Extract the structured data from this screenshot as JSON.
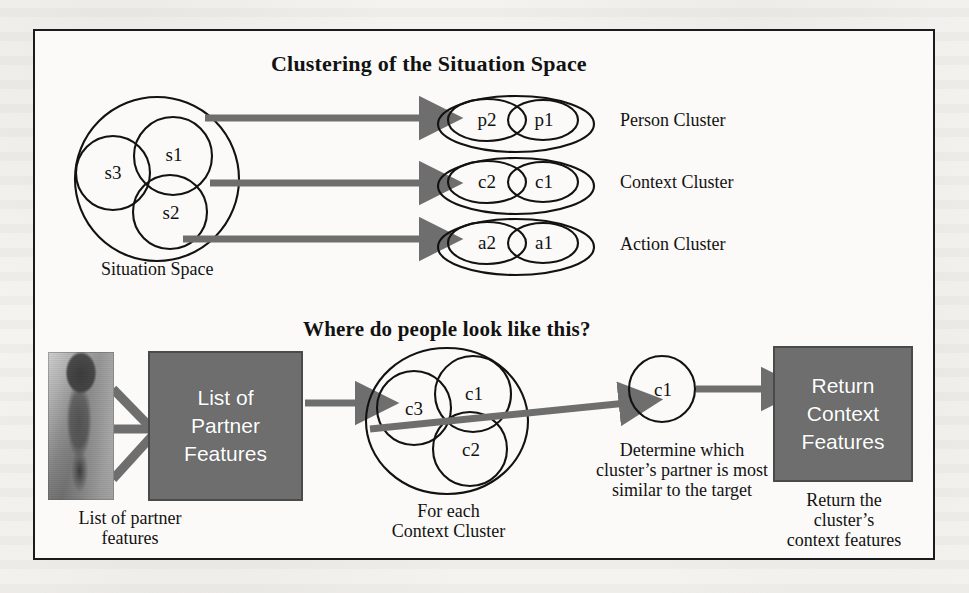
{
  "figure": {
    "top_section": {
      "title": "Clustering of the Situation Space",
      "source": {
        "label": "Situation Space",
        "members": [
          "s3",
          "s1",
          "s2"
        ]
      },
      "clusters": [
        {
          "members": [
            "p2",
            "p1"
          ],
          "label": "Person Cluster"
        },
        {
          "members": [
            "c2",
            "c1"
          ],
          "label": "Context Cluster"
        },
        {
          "members": [
            "a2",
            "a1"
          ],
          "label": "Action Cluster"
        }
      ]
    },
    "bottom_section": {
      "title": "Where do people look like this?",
      "photo": {
        "alt": "person-photo",
        "caption_line1": "List of partner",
        "caption_line2": "features"
      },
      "input_box": {
        "line1": "List of",
        "line2": "Partner",
        "line3": "Features"
      },
      "cluster": {
        "members": [
          "c3",
          "c1",
          "c2"
        ],
        "caption_line1": "For each",
        "caption_line2": "Context Cluster"
      },
      "selected_node": {
        "label": "c1",
        "caption_line1": "Determine which",
        "caption_line2": "cluster’s partner is most",
        "caption_line3": "similar to the target"
      },
      "output_box": {
        "line1": "Return",
        "line2": "Context",
        "line3": "Features",
        "caption_line1": "Return the",
        "caption_line2": "cluster’s",
        "caption_line3": "context features"
      }
    }
  },
  "colors": {
    "arrow_gray": "#6e6e6e",
    "box_gray": "#6e6e6e",
    "box_border": "#4a4a4a",
    "box_text": "#ffffff",
    "outline": "#121212",
    "frame_border": "#1b1b1b",
    "paper": "#fbfaf8"
  },
  "icons": {
    "arrow": "arrow-right-icon",
    "photo": "person-photo-icon"
  }
}
